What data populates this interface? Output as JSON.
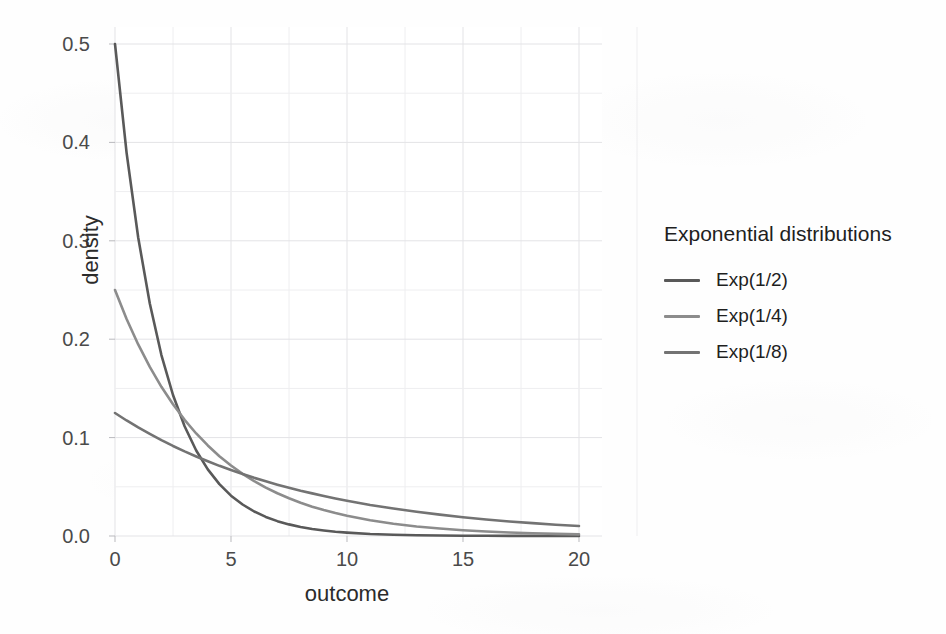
{
  "chart_data": {
    "type": "line",
    "title": "",
    "xlabel": "outcome",
    "ylabel": "density",
    "xlim": [
      0,
      20
    ],
    "ylim": [
      0.0,
      0.5
    ],
    "xticks": [
      "0",
      "5",
      "10",
      "15",
      "20"
    ],
    "xtick_values": [
      0,
      5,
      10,
      15,
      20
    ],
    "yticks": [
      "0.0",
      "0.1",
      "0.2",
      "0.3",
      "0.4",
      "0.5"
    ],
    "ytick_values": [
      0.0,
      0.1,
      0.2,
      0.3,
      0.4,
      0.5
    ],
    "grid": "major-and-minor",
    "legend_position": "right",
    "legend_title": "Exponential distributions",
    "x": [
      0,
      0.5,
      1,
      1.5,
      2,
      2.5,
      3,
      3.5,
      4,
      4.5,
      5,
      5.5,
      6,
      6.5,
      7,
      7.5,
      8,
      8.5,
      9,
      9.5,
      10,
      11,
      12,
      13,
      14,
      15,
      16,
      17,
      18,
      19,
      20
    ],
    "series": [
      {
        "name": "Exp(1/2)",
        "rate": 0.5,
        "color": "#595959",
        "values": [
          0.5,
          0.3894,
          0.3033,
          0.2362,
          0.1839,
          0.1433,
          0.1116,
          0.0869,
          0.0677,
          0.0527,
          0.041,
          0.032,
          0.0249,
          0.0194,
          0.0151,
          0.0118,
          0.0092,
          0.0071,
          0.0056,
          0.0043,
          0.0034,
          0.002,
          0.0012,
          0.0008,
          0.0005,
          0.0003,
          0.0002,
          0.0001,
          0.0001,
          0.0,
          0.0
        ]
      },
      {
        "name": "Exp(1/4)",
        "rate": 0.25,
        "color": "#8c8c8c",
        "values": [
          0.25,
          0.2206,
          0.1947,
          0.1718,
          0.1516,
          0.1338,
          0.1181,
          0.1042,
          0.092,
          0.0811,
          0.0716,
          0.0632,
          0.0558,
          0.0492,
          0.0434,
          0.0383,
          0.0338,
          0.0298,
          0.0264,
          0.0233,
          0.0205,
          0.016,
          0.0124,
          0.0097,
          0.0076,
          0.0059,
          0.0046,
          0.0036,
          0.0028,
          0.0022,
          0.0017
        ]
      },
      {
        "name": "Exp(1/8)",
        "rate": 0.125,
        "color": "#737373",
        "values": [
          0.125,
          0.1174,
          0.1103,
          0.1037,
          0.0974,
          0.0915,
          0.086,
          0.0808,
          0.0759,
          0.0713,
          0.067,
          0.063,
          0.0591,
          0.0556,
          0.0522,
          0.049,
          0.046,
          0.0433,
          0.0407,
          0.0382,
          0.0359,
          0.0316,
          0.0279,
          0.0246,
          0.0217,
          0.0191,
          0.0168,
          0.0148,
          0.0131,
          0.0115,
          0.0102
        ]
      }
    ]
  },
  "axes": {
    "ylabel": "density",
    "xlabel": "outcome"
  },
  "legend": {
    "title": "Exponential distributions",
    "items": [
      {
        "label": "Exp(1/2)",
        "color": "#595959"
      },
      {
        "label": "Exp(1/4)",
        "color": "#8c8c8c"
      },
      {
        "label": "Exp(1/8)",
        "color": "#737373"
      }
    ]
  },
  "colors": {
    "panel_background": "#ffffff",
    "gridline_major": "#e3e3e6",
    "gridline_minor": "#eeeef0",
    "tick_text": "#4a4a4a",
    "axis_title": "#2b2b2b"
  }
}
